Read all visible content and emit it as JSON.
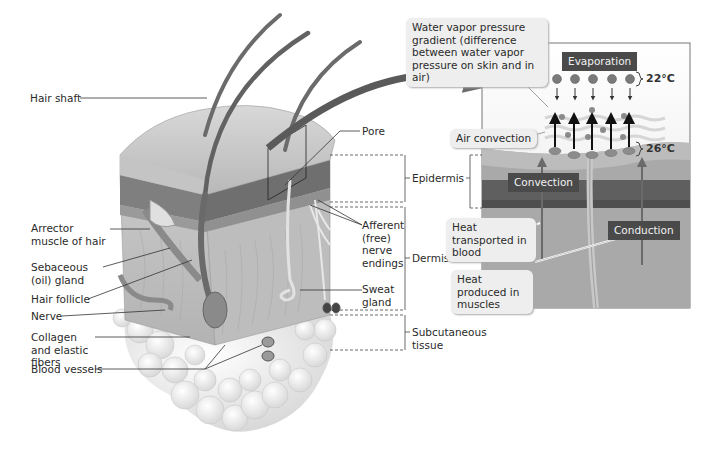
{
  "skin_labels_left": {
    "hair_shaft": "Hair shaft",
    "arrector_muscle": "Arrector muscle of hair",
    "sebaceous_gland": "Sebaceous (oil) gland",
    "hair_follicle": "Hair follicle",
    "nerve": "Nerve",
    "collagen": "Collagen and elastic fibers",
    "blood_vessels": "Blood vessels"
  },
  "skin_labels_right": {
    "pore": "Pore",
    "afferent": "Afferent (free) nerve endings",
    "sweat_gland": "Sweat gland"
  },
  "layers": {
    "epidermis": "Epidermis",
    "dermis": "Dermis",
    "subcutaneous": "Subcutaneous tissue"
  },
  "panel": {
    "vapor_callout": "Water vapor pressure gradient (difference between water vapor pressure on skin and in air)",
    "evaporation": "Evaporation",
    "temp_air": "22°C",
    "temp_skin": "26°C",
    "air_convection": "Air convection",
    "convection": "Convection",
    "conduction": "Conduction",
    "heat_blood": "Heat transported in blood",
    "heat_muscles": "Heat produced in muscles"
  },
  "colors": {
    "epidermis_band": "#8c8c8c",
    "dermis": "#a6a6a6",
    "dark_band": "#5a5a5a",
    "tag_bg": "#4a4a4a",
    "callout_bg": "#eeeeee",
    "fat": "#f2f2f2"
  }
}
